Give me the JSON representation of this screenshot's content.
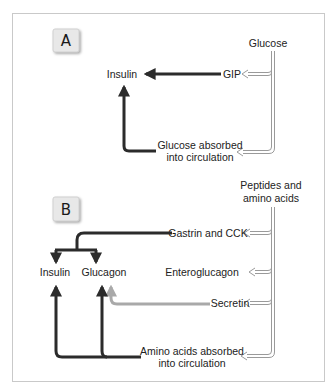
{
  "diagram": {
    "panel_a": {
      "label": "A",
      "source": "Glucose",
      "hormone_target": "Insulin",
      "intermediates": [
        "GIP"
      ],
      "absorbed_line1": "Glucose absorbed",
      "absorbed_line2": "into circulation"
    },
    "panel_b": {
      "label": "B",
      "source_line1": "Peptides and",
      "source_line2": "amino acids",
      "targets": [
        "Insulin",
        "Glucagon"
      ],
      "intermediates": [
        "Gastrin and CCK",
        "Enteroglucagon",
        "Secretin"
      ],
      "absorbed_line1": "Amino acids absorbed",
      "absorbed_line2": "into circulation"
    },
    "colors": {
      "stimulus_arrow": "#2b2b2b",
      "secretin_arrow": "#a9a9a9",
      "hollow_arrow": "#9a9a9a",
      "frame": "#c9c9c9",
      "label_box": "#e6e6e6"
    }
  }
}
